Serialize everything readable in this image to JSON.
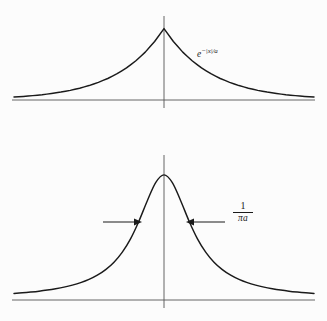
{
  "figure": {
    "background_color": "#fcfcfc",
    "ink_color": "#1a1a1a",
    "axis_color": "#555555",
    "width": 327,
    "height": 321,
    "labels": {
      "exponential_base": "e",
      "exponential_exponent": "−|x|/a",
      "width_numerator": "1",
      "width_denominator": "πa"
    }
  },
  "chart_data": [
    {
      "type": "line",
      "title": "",
      "subtitle": "",
      "panel": "top",
      "function": "exp(-|x|/a)",
      "annotations": [
        {
          "name": "curve-label",
          "text": "e^{-|x|/a}",
          "x": 1.55,
          "y": 0.52
        }
      ],
      "xlabel": "",
      "ylabel": "",
      "xlim": [
        -3.2,
        3.2
      ],
      "ylim": [
        0,
        1.12
      ],
      "grid": false,
      "legend": false,
      "peak_value": 1.0,
      "peak_x": 0.0,
      "peak_shape": "cusp",
      "decay_constant_a": 1.0,
      "x": [
        -3.2,
        -3.0,
        -2.8,
        -2.6,
        -2.4,
        -2.2,
        -2.0,
        -1.8,
        -1.6,
        -1.4,
        -1.2,
        -1.0,
        -0.8,
        -0.6,
        -0.4,
        -0.2,
        0.0,
        0.2,
        0.4,
        0.6,
        0.8,
        1.0,
        1.2,
        1.4,
        1.6,
        1.8,
        2.0,
        2.2,
        2.4,
        2.6,
        2.8,
        3.0,
        3.2
      ],
      "values": [
        0.041,
        0.05,
        0.061,
        0.074,
        0.091,
        0.111,
        0.135,
        0.165,
        0.202,
        0.247,
        0.301,
        0.368,
        0.449,
        0.549,
        0.67,
        0.819,
        1.0,
        0.819,
        0.67,
        0.549,
        0.449,
        0.368,
        0.301,
        0.247,
        0.202,
        0.165,
        0.135,
        0.111,
        0.091,
        0.074,
        0.061,
        0.05,
        0.041
      ]
    },
    {
      "type": "line",
      "title": "",
      "subtitle": "",
      "panel": "bottom",
      "function": "Lorentzian: 1/(1+(x/w)^2)",
      "annotations": [
        {
          "name": "width-label",
          "text": "1/(pi a)",
          "x": 1.95,
          "y": 0.52
        },
        {
          "name": "left-width-arrow",
          "text": "",
          "direction": "right",
          "from_x": -2.05,
          "to_x": -0.78,
          "y": 0.5
        },
        {
          "name": "right-width-arrow",
          "text": "",
          "direction": "left",
          "from_x": 1.62,
          "to_x": 0.78,
          "y": 0.5
        }
      ],
      "xlabel": "",
      "ylabel": "",
      "xlim": [
        -3.6,
        3.6
      ],
      "ylim": [
        0,
        1.12
      ],
      "grid": false,
      "legend": false,
      "peak_value": 1.0,
      "peak_x": 0.0,
      "peak_shape": "rounded",
      "half_width_label": "1/(pi a)",
      "half_width_value": 0.78,
      "x": [
        -3.6,
        -3.4,
        -3.2,
        -3.0,
        -2.8,
        -2.6,
        -2.4,
        -2.2,
        -2.0,
        -1.8,
        -1.6,
        -1.4,
        -1.2,
        -1.0,
        -0.8,
        -0.6,
        -0.4,
        -0.2,
        0.0,
        0.2,
        0.4,
        0.6,
        0.8,
        1.0,
        1.2,
        1.4,
        1.6,
        1.8,
        2.0,
        2.2,
        2.4,
        2.6,
        2.8,
        3.0,
        3.2,
        3.4,
        3.6
      ],
      "values": [
        0.045,
        0.05,
        0.056,
        0.063,
        0.072,
        0.083,
        0.096,
        0.112,
        0.132,
        0.158,
        0.192,
        0.237,
        0.297,
        0.378,
        0.487,
        0.629,
        0.792,
        0.938,
        1.0,
        0.938,
        0.792,
        0.629,
        0.487,
        0.378,
        0.297,
        0.237,
        0.192,
        0.158,
        0.132,
        0.112,
        0.096,
        0.083,
        0.072,
        0.063,
        0.056,
        0.05,
        0.045
      ]
    }
  ]
}
